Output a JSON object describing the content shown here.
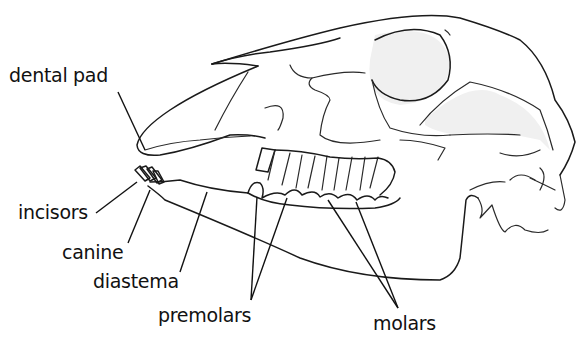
{
  "figure": {
    "labels": [
      {
        "id": "dental-pad",
        "text": "dental pad"
      },
      {
        "id": "incisors",
        "text": "incisors"
      },
      {
        "id": "canine",
        "text": "canine"
      },
      {
        "id": "diastema",
        "text": "diastema"
      },
      {
        "id": "premolars",
        "text": "premolars"
      },
      {
        "id": "molars",
        "text": "molars"
      }
    ]
  }
}
